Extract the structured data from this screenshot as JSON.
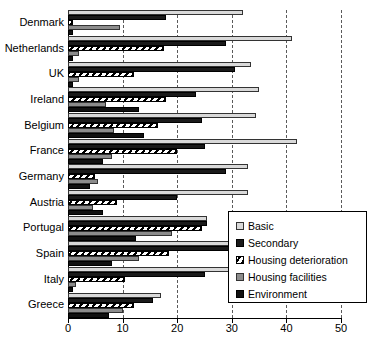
{
  "chart_data": {
    "type": "bar",
    "orientation": "horizontal",
    "title": "",
    "xlabel": "",
    "ylabel": "",
    "xlim": [
      0,
      50
    ],
    "xticks": [
      0,
      10,
      20,
      30,
      40,
      50
    ],
    "grid": "vertical-dashed",
    "legend_position": "inside-bottom-right",
    "categories": [
      "Denmark",
      "Netherlands",
      "UK",
      "Ireland",
      "Belgium",
      "France",
      "Germany",
      "Austria",
      "Portugal",
      "Spain",
      "Italy",
      "Greece"
    ],
    "series": [
      {
        "name": "Basic",
        "color": "#d9d9d9",
        "values": [
          32.0,
          41.0,
          33.5,
          35.0,
          34.5,
          42.0,
          33.0,
          33.0,
          25.5,
          38.0,
          35.0,
          17.0
        ]
      },
      {
        "name": "Secondary",
        "color": "#1a1a1a",
        "values": [
          18.0,
          29.0,
          30.5,
          23.5,
          24.5,
          25.0,
          29.0,
          20.0,
          25.5,
          32.0,
          25.0,
          15.5
        ]
      },
      {
        "name": "Housing deterioration",
        "color": "#ffffff",
        "pattern": "diagonal-hatch",
        "values": [
          1.0,
          17.5,
          12.0,
          18.0,
          16.5,
          20.0,
          5.0,
          9.0,
          24.5,
          18.5,
          10.5,
          12.0
        ]
      },
      {
        "name": "Housing facilities",
        "color": "#8c8c8c",
        "values": [
          9.5,
          2.0,
          2.0,
          7.0,
          8.5,
          8.0,
          5.5,
          4.5,
          19.0,
          13.0,
          1.5,
          10.0
        ]
      },
      {
        "name": "Environment",
        "color": "#111111",
        "values": [
          1.0,
          1.0,
          1.0,
          13.0,
          14.0,
          6.5,
          4.0,
          6.5,
          12.5,
          8.0,
          1.0,
          7.5
        ]
      }
    ]
  },
  "legend": {
    "items": [
      {
        "label": "Basic",
        "swatch": "legend-swatch-basic"
      },
      {
        "label": "Secondary",
        "swatch": "legend-swatch-secondary"
      },
      {
        "label": "Housing deterioration",
        "swatch": "legend-swatch-housing-deterioration"
      },
      {
        "label": "Housing facilities",
        "swatch": "legend-swatch-housing-facilities"
      },
      {
        "label": "Environment",
        "swatch": "legend-swatch-environment"
      }
    ]
  }
}
